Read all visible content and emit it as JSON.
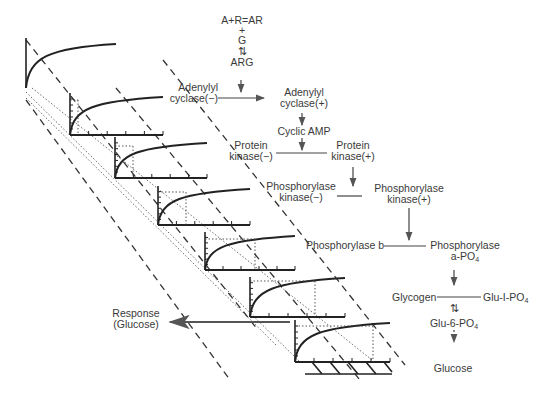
{
  "diagram": {
    "receptor": {
      "line1": "A+R=AR",
      "line2": "+",
      "line3": "G",
      "line4": "⇅",
      "line5": "ARG"
    },
    "nodes": {
      "adenylyl_cyclase_inactive": {
        "line1": "Adenylyl",
        "line2": "cyclase(−)"
      },
      "adenylyl_cyclase_active": {
        "line1": "Adenylyl",
        "line2": "cyclase(+)"
      },
      "cyclic_amp": "Cyclic AMP",
      "protein_kinase_inactive": {
        "line1": "Protein",
        "line2": "kinase(−)"
      },
      "protein_kinase_active": {
        "line1": "Protein",
        "line2": "kinase(+)"
      },
      "phosphorylase_kinase_inactive": {
        "line1": "Phosphorylase",
        "line2": "kinase(−)"
      },
      "phosphorylase_kinase_active": {
        "line1": "Phosphorylase",
        "line2": "kinase(+)"
      },
      "phosphorylase_b": "Phosphorylase b",
      "phosphorylase_a": {
        "line1": "Phosphorylase",
        "line2_prefix": "a-PO",
        "line2_sub": "4"
      },
      "glycogen": "Glycogen",
      "glu1po4": {
        "prefix": "Glu-I-PO",
        "sub": "4"
      },
      "equilibrium_symbol": "⇅",
      "glu6po4": {
        "prefix": "Glu-6-PO",
        "sub": "4"
      },
      "glucose": "Glucose"
    },
    "response": {
      "line1": "Response",
      "line2": "(Glucose)"
    },
    "plots": [
      {
        "ox": 26,
        "oy": 88,
        "h": 50,
        "w": 90,
        "curve_end_y": 44,
        "has_x_axis": false,
        "dotted_x": null
      },
      {
        "ox": 70,
        "oy": 135,
        "h": 42,
        "w": 93,
        "curve_end_y": 97,
        "has_x_axis": true,
        "dotted_x": 8
      },
      {
        "ox": 115,
        "oy": 178,
        "h": 41,
        "w": 92,
        "curve_end_y": 143,
        "has_x_axis": true,
        "dotted_x": 18
      },
      {
        "ox": 158,
        "oy": 225,
        "h": 39,
        "w": 92,
        "curve_end_y": 189,
        "has_x_axis": true,
        "dotted_x": 28
      },
      {
        "ox": 205,
        "oy": 270,
        "h": 38,
        "w": 90,
        "curve_end_y": 236,
        "has_x_axis": true,
        "dotted_x": 50
      },
      {
        "ox": 250,
        "oy": 317,
        "h": 40,
        "w": 95,
        "curve_end_y": 278,
        "has_x_axis": true,
        "dotted_x": 65
      },
      {
        "ox": 295,
        "oy": 362,
        "h": 42,
        "w": 95,
        "curve_end_y": 323,
        "has_x_axis": true,
        "dotted_x": 78
      }
    ]
  }
}
